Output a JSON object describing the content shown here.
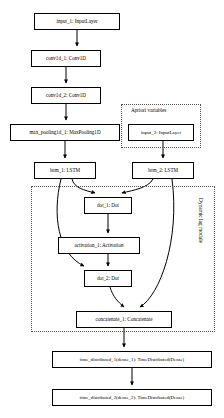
{
  "diagram": {
    "type": "neural-network-graph",
    "background": "#ffffff",
    "stroke": "#000000",
    "group_stroke": "#555555",
    "nodes": [
      {
        "id": "input_1",
        "label": "input_1: InputLayer",
        "x": 34,
        "y": 13,
        "w": 86,
        "h": 17,
        "fs": 5.1
      },
      {
        "id": "conv1d_1",
        "label": "conv1d_1: Conv1D",
        "x": 31,
        "y": 50,
        "w": 70,
        "h": 17,
        "fs": 5.1
      },
      {
        "id": "conv1d_2",
        "label": "conv1d_2: Conv1D",
        "x": 31,
        "y": 87,
        "w": 70,
        "h": 17,
        "fs": 5.1
      },
      {
        "id": "max_pooling1d_1",
        "label": "max_pooling1d_1: MaxPooling1D",
        "x": 10,
        "y": 124,
        "w": 110,
        "h": 17,
        "fs": 5.1
      },
      {
        "id": "input_2",
        "label": "input_2: InputLayer",
        "x": 128,
        "y": 124,
        "w": 66,
        "h": 17,
        "fs": 5.0
      },
      {
        "id": "lstm_1",
        "label": "lstm_1: LSTM",
        "x": 34,
        "y": 162,
        "w": 62,
        "h": 17,
        "fs": 5.1
      },
      {
        "id": "lstm_2",
        "label": "lstm_2: LSTM",
        "x": 132,
        "y": 162,
        "w": 62,
        "h": 17,
        "fs": 5.1
      },
      {
        "id": "dot_1",
        "label": "dot_1: Dot",
        "x": 84,
        "y": 197,
        "w": 48,
        "h": 17,
        "fs": 5.1
      },
      {
        "id": "activation_1",
        "label": "activation_1: Activation",
        "x": 58,
        "y": 237,
        "w": 82,
        "h": 17,
        "fs": 5.1
      },
      {
        "id": "dot_2",
        "label": "dot_2: Dot",
        "x": 84,
        "y": 270,
        "w": 48,
        "h": 17,
        "fs": 5.1
      },
      {
        "id": "concatenate_1",
        "label": "concatenate_1: Concatenate",
        "x": 76,
        "y": 311,
        "w": 96,
        "h": 17,
        "fs": 5.1
      },
      {
        "id": "time_distributed_1",
        "label": "time_distributed_1(dense_1): TimeDistributed(Dense)",
        "x": 52,
        "y": 351,
        "w": 160,
        "h": 17,
        "fs": 4.8
      },
      {
        "id": "time_distributed_2",
        "label": "time_distributed_2(dense_2): TimeDistributed(Dense)",
        "x": 52,
        "y": 389,
        "w": 160,
        "h": 17,
        "fs": 4.8
      }
    ],
    "groups": [
      {
        "id": "apriori",
        "label": "Apriori variables",
        "x": 121,
        "y": 104,
        "w": 80,
        "h": 44,
        "label_x": 131,
        "label_y": 107,
        "label_fs": 5.2,
        "orientation": "horizontal"
      },
      {
        "id": "dynamic_lag",
        "label": "Dynamic lag module",
        "x": 31,
        "y": 186,
        "w": 184,
        "h": 146,
        "label_x": 204,
        "label_y": 198,
        "label_fs": 5.4,
        "orientation": "vertical"
      }
    ],
    "edges": [
      {
        "from": "input_1",
        "to": "conv1d_1",
        "kind": "straight"
      },
      {
        "from": "conv1d_1",
        "to": "conv1d_2",
        "kind": "straight"
      },
      {
        "from": "conv1d_2",
        "to": "max_pooling1d_1",
        "kind": "straight"
      },
      {
        "from": "max_pooling1d_1",
        "to": "lstm_1",
        "kind": "straight"
      },
      {
        "from": "input_2",
        "to": "lstm_2",
        "kind": "straight"
      },
      {
        "from": "lstm_1",
        "to": "dot_1",
        "kind": "curved"
      },
      {
        "from": "lstm_2",
        "to": "dot_1",
        "kind": "curved"
      },
      {
        "from": "dot_1",
        "to": "activation_1",
        "kind": "straight"
      },
      {
        "from": "activation_1",
        "to": "dot_2",
        "kind": "straight"
      },
      {
        "from": "lstm_1",
        "to": "dot_2",
        "kind": "curved"
      },
      {
        "from": "lstm_2",
        "to": "concatenate_1",
        "kind": "curved"
      },
      {
        "from": "dot_2",
        "to": "concatenate_1",
        "kind": "curved"
      },
      {
        "from": "concatenate_1",
        "to": "time_distributed_1",
        "kind": "straight"
      },
      {
        "from": "time_distributed_1",
        "to": "time_distributed_2",
        "kind": "straight"
      }
    ],
    "edge_paths": [
      {
        "id": "e-input1-conv1",
        "d": "M 77,30  L 77,46",
        "arrow": true
      },
      {
        "id": "e-conv1-conv2",
        "d": "M 66,67  L 66,83",
        "arrow": true
      },
      {
        "id": "e-conv2-pool",
        "d": "M 66,104 L 66,120",
        "arrow": true
      },
      {
        "id": "e-pool-lstm1",
        "d": "M 65,141 L 65,158",
        "arrow": true
      },
      {
        "id": "e-input2-lstm2",
        "d": "M 163,141 L 163,158",
        "arrow": true
      },
      {
        "id": "e-lstm1-dot1",
        "d": "M 72,179 C 74,188 84,190 95,193",
        "arrow": true
      },
      {
        "id": "e-lstm2-dot1",
        "d": "M 153,179 C 148,188 134,190 122,193",
        "arrow": true
      },
      {
        "id": "e-dot1-act1",
        "d": "M 108,214 L 108,233",
        "arrow": true
      },
      {
        "id": "e-act1-dot2",
        "d": "M 108,254 L 108,266",
        "arrow": true
      },
      {
        "id": "e-lstm1-dot2",
        "d": "M 61,179 C 52,215 58,254 84,266",
        "arrow": true
      },
      {
        "id": "e-lstm2-concat",
        "d": "M 172,179 C 180,240 160,295 140,307",
        "arrow": true
      },
      {
        "id": "e-dot2-concat",
        "d": "M 110,287 C 113,297 118,302 124,307",
        "arrow": true
      },
      {
        "id": "e-concat-td1",
        "d": "M 124,328 L 124,347",
        "arrow": true
      },
      {
        "id": "e-td1-td2",
        "d": "M 132,368 L 132,385",
        "arrow": true
      }
    ]
  }
}
